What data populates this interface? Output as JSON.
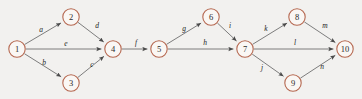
{
  "diagram": {
    "type": "directed-graph",
    "background_color": "#f2f1ef",
    "node_stroke_color": "#b5674f",
    "node_fill_color": "#faf7f4",
    "edge_color": "#6f6f6f",
    "label_color": "#1c1c1c",
    "node_radius": 8.2,
    "nodes": [
      {
        "id": "1",
        "label": "1",
        "x": 17,
        "y": 49
      },
      {
        "id": "2",
        "label": "2",
        "x": 71,
        "y": 17
      },
      {
        "id": "3",
        "label": "3",
        "x": 71,
        "y": 83
      },
      {
        "id": "4",
        "label": "4",
        "x": 113,
        "y": 49
      },
      {
        "id": "5",
        "label": "5",
        "x": 159,
        "y": 49
      },
      {
        "id": "6",
        "label": "6",
        "x": 211,
        "y": 17
      },
      {
        "id": "7",
        "label": "7",
        "x": 245,
        "y": 49
      },
      {
        "id": "8",
        "label": "8",
        "x": 297,
        "y": 17
      },
      {
        "id": "9",
        "label": "9",
        "x": 293,
        "y": 83
      },
      {
        "id": "10",
        "label": "10",
        "x": 345,
        "y": 49
      }
    ],
    "edges": [
      {
        "id": "e-a",
        "label": "a",
        "from": "1",
        "to": "2",
        "label_x": 41,
        "label_y": 29
      },
      {
        "id": "e-b",
        "label": "b",
        "from": "1",
        "to": "3",
        "label_x": 44,
        "label_y": 62
      },
      {
        "id": "e-c",
        "label": "c",
        "from": "3",
        "to": "4",
        "label_x": 92,
        "label_y": 64
      },
      {
        "id": "e-d",
        "label": "d",
        "from": "2",
        "to": "4",
        "label_x": 97,
        "label_y": 25
      },
      {
        "id": "e-e",
        "label": "e",
        "from": "1",
        "to": "4",
        "label_x": 66,
        "label_y": 43
      },
      {
        "id": "e-f",
        "label": "f",
        "from": "4",
        "to": "5",
        "label_x": 136,
        "label_y": 42
      },
      {
        "id": "e-g",
        "label": "g",
        "from": "5",
        "to": "6",
        "label_x": 184,
        "label_y": 28
      },
      {
        "id": "e-h",
        "label": "h",
        "from": "5",
        "to": "7",
        "label_x": 205,
        "label_y": 42
      },
      {
        "id": "e-i",
        "label": "i",
        "from": "6",
        "to": "7",
        "label_x": 230,
        "label_y": 25
      },
      {
        "id": "e-j",
        "label": "j",
        "from": "7",
        "to": "9",
        "label_x": 262,
        "label_y": 67
      },
      {
        "id": "e-k",
        "label": "k",
        "from": "7",
        "to": "8",
        "label_x": 266,
        "label_y": 28
      },
      {
        "id": "e-l",
        "label": "l",
        "from": "7",
        "to": "10",
        "label_x": 295,
        "label_y": 42
      },
      {
        "id": "e-m",
        "label": "m",
        "from": "8",
        "to": "10",
        "label_x": 325,
        "label_y": 25
      },
      {
        "id": "e-n",
        "label": "n",
        "from": "9",
        "to": "10",
        "label_x": 322,
        "label_y": 66
      }
    ]
  }
}
